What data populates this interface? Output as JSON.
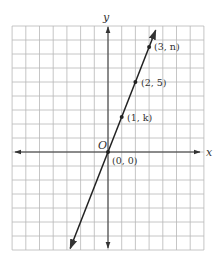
{
  "chart_data": {
    "type": "line",
    "title": "",
    "xlabel": "x",
    "ylabel": "y",
    "origin_label": "O",
    "grid": true,
    "xlim": [
      -7,
      7
    ],
    "ylim": [
      -7,
      9
    ],
    "series": [
      {
        "name": "line through origin",
        "equation": "y = 2.5x",
        "x": [
          0,
          1,
          2,
          3
        ],
        "y": [
          0,
          2.5,
          5,
          7.5
        ]
      }
    ],
    "points": [
      {
        "x": 0,
        "y": 0,
        "label": "(0, 0)"
      },
      {
        "x": 1,
        "y": 2.5,
        "label": "(1, k)"
      },
      {
        "x": 2,
        "y": 5,
        "label": "(2, 5)"
      },
      {
        "x": 3,
        "y": 7.5,
        "label": "(3, n)"
      }
    ]
  },
  "labels": {
    "x_axis": "x",
    "y_axis": "y",
    "origin": "O",
    "p0": "(0, 0)",
    "p1": "(1, k)",
    "p2": "(2, 5)",
    "p3": "(3, n)"
  },
  "colors": {
    "grid": "#b8b8b8",
    "axis": "#333333",
    "line": "#222222"
  }
}
